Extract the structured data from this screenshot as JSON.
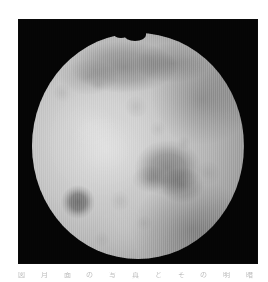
{
  "page": {
    "background_color": "#ffffff",
    "width": 268,
    "height": 282
  },
  "figure": {
    "name": "lunar-photograph-plate",
    "panel_background_color": "#050505",
    "panel": {
      "x": 18,
      "y": 19,
      "width": 240,
      "height": 245
    },
    "rendering": "monochrome halftone / facsimile scan with fine vertical scan-lines",
    "disc": {
      "center_x": 138,
      "center_y": 146,
      "radius_x": 106,
      "radius_y": 113,
      "highlight_color": "#d8d8d8",
      "midtone_color": "#9d9d9d",
      "limb_color": "#1d1d1d",
      "terminator_side": "right"
    },
    "features": [
      {
        "name": "upper-dark-band",
        "x": 110,
        "y": 67,
        "tone": "dark"
      },
      {
        "name": "upper-right-dark-quadrant",
        "x": 188,
        "y": 99,
        "tone": "dark"
      },
      {
        "name": "central-maria-patch",
        "x": 168,
        "y": 168,
        "tone": "dark"
      },
      {
        "name": "lower-left-crater-spot",
        "x": 78,
        "y": 202,
        "tone": "very dark"
      },
      {
        "name": "bright-highland",
        "x": 110,
        "y": 150,
        "tone": "bright"
      },
      {
        "name": "limb-notch",
        "x": 130,
        "y": 33,
        "tone": "black"
      }
    ]
  },
  "caption": {
    "visible": "partially clipped at the page bottom edge",
    "text": "図　　月　　面　　の　　写　　真　　と　　そ　　の　　明　　暗　　の　　分　　布"
  }
}
